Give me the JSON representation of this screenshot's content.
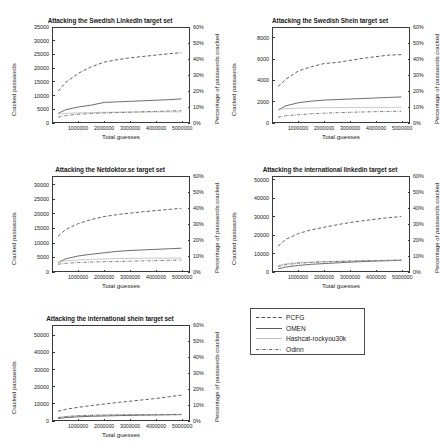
{
  "figure": {
    "xlabel": "Total guesses",
    "ylabel_left": "Cracked passwords",
    "ylabel_right": "Percentage of passwords cracked",
    "xticks": [
      "1000000",
      "2000000",
      "3000000",
      "4000000",
      "5000000"
    ],
    "xtick_values": [
      1000000,
      2000000,
      3000000,
      4000000,
      5000000
    ],
    "xlim": [
      0,
      5300000
    ],
    "right_yticks": [
      "0%",
      "10%",
      "20%",
      "30%",
      "40%",
      "50%",
      "60%"
    ],
    "right_ylim": [
      0,
      60
    ]
  },
  "legend": {
    "position": "bottom-right-cell",
    "entries": [
      {
        "label": "PCFG",
        "style": "dashed"
      },
      {
        "label": "OMEN",
        "style": "solid"
      },
      {
        "label": "Hashcat-rockyou30k",
        "style": "solid-light"
      },
      {
        "label": "Odinn",
        "style": "dash-dot"
      }
    ]
  },
  "chart_data": [
    {
      "type": "line",
      "id": "swedish-linkedin",
      "title": "Attacking the Swedish LinkedIn target set",
      "xlabel": "Total guesses",
      "ylabel": "Cracked passwords",
      "ylabel_right": "Percentage of passwords cracked",
      "yticks": [
        "0",
        "5000",
        "10000",
        "15000",
        "20000",
        "25000",
        "30000",
        "35000"
      ],
      "ylim": [
        0,
        35000
      ],
      "right_ylim": [
        0,
        60
      ],
      "grid": false,
      "legend_position": "external",
      "x": [
        200000,
        500000,
        1000000,
        1500000,
        2000000,
        2500000,
        3000000,
        3500000,
        4000000,
        4500000,
        5000000
      ],
      "series": [
        {
          "name": "PCFG",
          "style": "dashed",
          "values": [
            11500,
            14800,
            18200,
            20600,
            22300,
            23200,
            23900,
            24400,
            24900,
            25400,
            25800
          ]
        },
        {
          "name": "OMEN",
          "style": "solid",
          "values": [
            3200,
            4600,
            5600,
            6300,
            7300,
            7500,
            7700,
            7900,
            8100,
            8300,
            8600
          ]
        },
        {
          "name": "Hashcat-rockyou30k",
          "style": "solid-light",
          "values": [
            2900,
            3200,
            3400,
            3500,
            3600,
            3650,
            3700,
            3720,
            3750,
            3780,
            3800
          ]
        },
        {
          "name": "Odinn",
          "style": "dash-dot",
          "values": [
            1800,
            2400,
            2900,
            3150,
            3350,
            3500,
            3650,
            3800,
            3950,
            4100,
            4250
          ]
        }
      ]
    },
    {
      "type": "line",
      "id": "swedish-shein",
      "title": "Attacking the Swedish Shein target set",
      "xlabel": "Total guesses",
      "ylabel": "Cracked passwords",
      "ylabel_right": "Percentage of passwords cracked",
      "yticks": [
        "0",
        "2000",
        "4000",
        "6000",
        "8000"
      ],
      "ylim": [
        0,
        9000
      ],
      "right_ylim": [
        0,
        60
      ],
      "grid": false,
      "legend_position": "external",
      "x": [
        200000,
        500000,
        1000000,
        1500000,
        2000000,
        2500000,
        3000000,
        3500000,
        4000000,
        4500000,
        5000000
      ],
      "series": [
        {
          "name": "PCFG",
          "style": "dashed",
          "values": [
            3400,
            4100,
            4900,
            5300,
            5600,
            5700,
            5900,
            6100,
            6250,
            6400,
            6450
          ]
        },
        {
          "name": "OMEN",
          "style": "solid",
          "values": [
            1150,
            1550,
            1850,
            2000,
            2100,
            2150,
            2200,
            2250,
            2300,
            2350,
            2400
          ]
        },
        {
          "name": "Hashcat-rockyou30k",
          "style": "solid-light",
          "values": [
            1200,
            1280,
            1320,
            1350,
            1370,
            1380,
            1390,
            1395,
            1400,
            1405,
            1410
          ]
        },
        {
          "name": "Odinn",
          "style": "dash-dot",
          "values": [
            450,
            600,
            700,
            780,
            840,
            890,
            930,
            960,
            990,
            1010,
            1030
          ]
        }
      ]
    },
    {
      "type": "line",
      "id": "netdoktor-se",
      "title": "Attacking the Netdoktor.se target set",
      "xlabel": "Total guesses",
      "ylabel": "Cracked passwords",
      "ylabel_right": "Percentage of passwords cracked",
      "yticks": [
        "0",
        "5000",
        "10000",
        "15000",
        "20000",
        "25000",
        "30000"
      ],
      "ylim": [
        0,
        33000
      ],
      "right_ylim": [
        0,
        60
      ],
      "grid": false,
      "legend_position": "external",
      "x": [
        200000,
        500000,
        1000000,
        1500000,
        2000000,
        2500000,
        3000000,
        3500000,
        4000000,
        4500000,
        5000000
      ],
      "series": [
        {
          "name": "PCFG",
          "style": "dashed",
          "values": [
            12200,
            14600,
            16700,
            18100,
            19100,
            19800,
            20300,
            20800,
            21200,
            21600,
            22000
          ]
        },
        {
          "name": "OMEN",
          "style": "solid",
          "values": [
            3000,
            4300,
            5300,
            5900,
            6400,
            6900,
            7200,
            7400,
            7600,
            7800,
            8000
          ]
        },
        {
          "name": "Hashcat-rockyou30k",
          "style": "solid-light",
          "values": [
            3100,
            3600,
            3900,
            4100,
            4250,
            4350,
            4420,
            4470,
            4500,
            4530,
            4560
          ]
        },
        {
          "name": "Odinn",
          "style": "dash-dot",
          "values": [
            2400,
            2700,
            3000,
            3150,
            3250,
            3350,
            3450,
            3550,
            3650,
            3750,
            3850
          ]
        }
      ]
    },
    {
      "type": "line",
      "id": "international-linkedin",
      "title": "Attacking the international linkedin target set",
      "xlabel": "Total guesses",
      "ylabel": "Cracked passwords",
      "ylabel_right": "Percentage of passwords cracked",
      "yticks": [
        "0",
        "10000",
        "20000",
        "30000",
        "40000",
        "50000"
      ],
      "ylim": [
        0,
        52000
      ],
      "right_ylim": [
        0,
        60
      ],
      "grid": false,
      "legend_position": "external",
      "x": [
        200000,
        500000,
        1000000,
        1500000,
        2000000,
        2500000,
        3000000,
        3500000,
        4000000,
        4500000,
        5000000
      ],
      "series": [
        {
          "name": "PCFG",
          "style": "dashed",
          "values": [
            13800,
            17500,
            20800,
            22800,
            24200,
            25600,
            26800,
            27800,
            28700,
            29500,
            30100
          ]
        },
        {
          "name": "OMEN",
          "style": "solid",
          "values": [
            1200,
            2200,
            3100,
            3700,
            4100,
            4500,
            4900,
            5200,
            5500,
            5700,
            5900
          ]
        },
        {
          "name": "Hashcat-rockyou30k",
          "style": "solid-light",
          "values": [
            3000,
            4000,
            4700,
            5000,
            5200,
            5400,
            5550,
            5700,
            5800,
            5900,
            6000
          ]
        },
        {
          "name": "Odinn",
          "style": "dash-dot",
          "values": [
            2500,
            3500,
            4300,
            4700,
            5000,
            5250,
            5450,
            5600,
            5750,
            5900,
            6050
          ]
        }
      ]
    },
    {
      "type": "line",
      "id": "international-shein",
      "title": "Attacking the international shein target set",
      "xlabel": "Total guesses",
      "ylabel": "Cracked passwords",
      "ylabel_right": "Percentage of passwords cracked",
      "yticks": [
        "0",
        "10000",
        "20000",
        "30000",
        "40000",
        "50000"
      ],
      "ylim": [
        0,
        56000
      ],
      "right_ylim": [
        0,
        60
      ],
      "grid": false,
      "legend_position": "external",
      "x": [
        200000,
        500000,
        1000000,
        1500000,
        2000000,
        2500000,
        3000000,
        3500000,
        4000000,
        4500000,
        5000000
      ],
      "series": [
        {
          "name": "PCFG",
          "style": "dashed",
          "values": [
            5200,
            6400,
            7600,
            8600,
            9500,
            10400,
            11200,
            12000,
            12800,
            13800,
            14800
          ]
        },
        {
          "name": "OMEN",
          "style": "solid",
          "values": [
            900,
            1400,
            1900,
            2200,
            2400,
            2600,
            2750,
            2900,
            3000,
            3100,
            3200
          ]
        },
        {
          "name": "Hashcat-rockyou30k",
          "style": "solid-light",
          "values": [
            1500,
            2100,
            2600,
            2850,
            3000,
            3100,
            3200,
            3250,
            3300,
            3350,
            3400
          ]
        },
        {
          "name": "Odinn",
          "style": "dash-dot",
          "values": [
            1400,
            2000,
            2500,
            2750,
            2900,
            3000,
            3100,
            3150,
            3200,
            3250,
            3300
          ]
        }
      ]
    }
  ]
}
